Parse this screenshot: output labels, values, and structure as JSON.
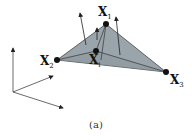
{
  "figure": {
    "caption": "(a)",
    "labels": {
      "x1": {
        "base": "X",
        "sub": "1"
      },
      "x2": {
        "base": "X",
        "sub": "2"
      },
      "x3": {
        "base": "X",
        "sub": "3"
      },
      "xi": {
        "base": "X",
        "sub": "i"
      }
    },
    "colors": {
      "face": "#9aa4ab",
      "edge": "#333333",
      "vertex": "#111111",
      "arrow": "#222222"
    }
  }
}
